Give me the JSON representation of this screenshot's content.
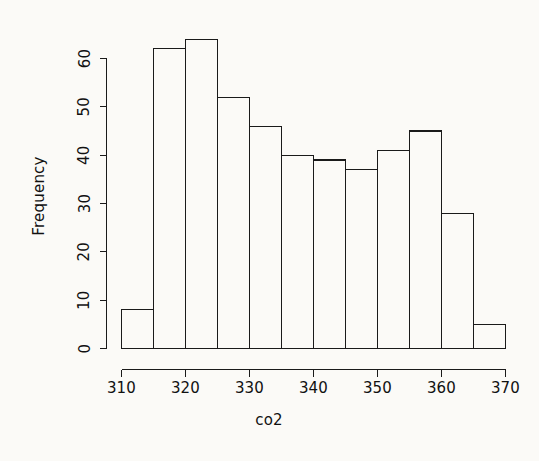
{
  "chart_data": {
    "type": "bar",
    "title": "",
    "subtitle": "",
    "xlabel": "co2",
    "ylabel": "Frequency",
    "categories": [
      "310-315",
      "315-320",
      "320-325",
      "325-330",
      "330-335",
      "335-340",
      "340-345",
      "345-350",
      "350-355",
      "355-360",
      "360-365",
      "365-370"
    ],
    "bin_edges": [
      310,
      315,
      320,
      325,
      330,
      335,
      340,
      345,
      350,
      355,
      360,
      365,
      370
    ],
    "bin_width": 5,
    "values": [
      8,
      62,
      64,
      52,
      46,
      40,
      39,
      37,
      41,
      45,
      28,
      5
    ],
    "xlim": [
      310,
      370
    ],
    "ylim": [
      0,
      64
    ],
    "y_axis_range": [
      0,
      60
    ],
    "x_ticks": [
      310,
      320,
      330,
      340,
      350,
      360,
      370
    ],
    "x_tick_labels": [
      "310",
      "320",
      "330",
      "340",
      "350",
      "360",
      "370"
    ],
    "y_ticks": [
      0,
      10,
      20,
      30,
      40,
      50,
      60
    ],
    "y_tick_labels": [
      "0",
      "10",
      "20",
      "30",
      "40",
      "50",
      "60"
    ],
    "grid": false,
    "legend": null,
    "bar_fill": "#fbfaf7",
    "bar_stroke": "#1a1a1a",
    "background": "#fbfaf7"
  },
  "labels": {
    "x_axis_title": "co2",
    "y_axis_title": "Frequency"
  }
}
